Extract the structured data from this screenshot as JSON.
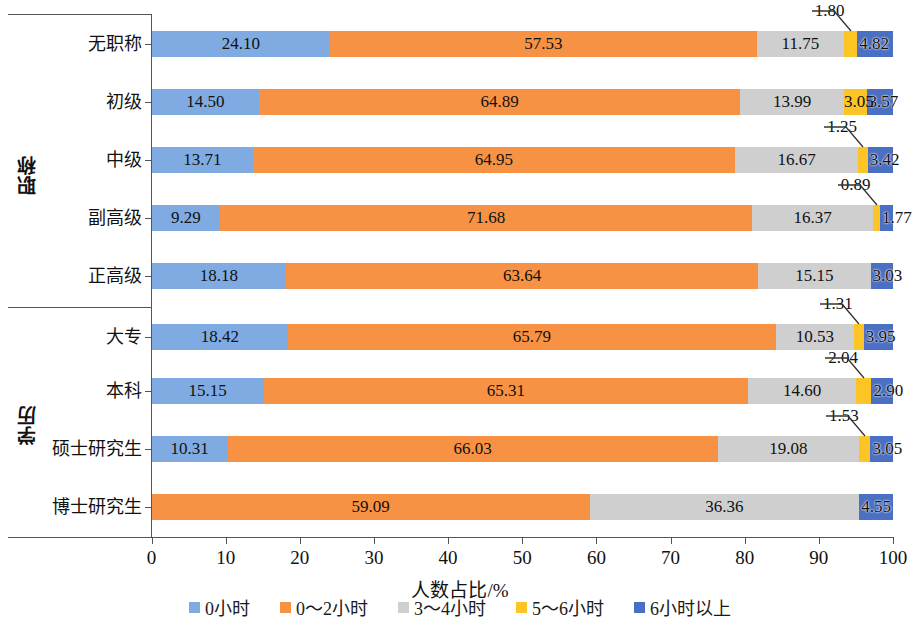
{
  "chart_data": {
    "type": "bar",
    "subtype": "horizontal-stacked-100",
    "title": "",
    "xlabel": "人数占比/%",
    "ylabel": "",
    "xlim": [
      0,
      100
    ],
    "xticks": [
      "0",
      "10",
      "20",
      "30",
      "40",
      "50",
      "60",
      "70",
      "80",
      "90",
      "100"
    ],
    "grid": false,
    "legend_position": "bottom",
    "legend": [
      "0小时",
      "0～2小时",
      "3～4小时",
      "5～6小时",
      "6小时以上"
    ],
    "series_colors": [
      "#7fabe2",
      "#f79244",
      "#cfcfcf",
      "#fcc425",
      "#4a6fc3"
    ],
    "groups": [
      {
        "name": "职称",
        "categories": [
          "无职称",
          "初级",
          "中级",
          "副高级",
          "正高级"
        ]
      },
      {
        "name": "学历",
        "categories": [
          "大专",
          "本科",
          "硕士研究生",
          "博士研究生"
        ]
      }
    ],
    "categories": [
      "无职称",
      "初级",
      "中级",
      "副高级",
      "正高级",
      "大专",
      "本科",
      "硕士研究生",
      "博士研究生"
    ],
    "series": [
      {
        "name": "0小时",
        "values": [
          24.1,
          14.5,
          13.71,
          9.29,
          18.18,
          18.42,
          15.15,
          10.31,
          0
        ]
      },
      {
        "name": "0～2小时",
        "values": [
          57.53,
          64.89,
          64.95,
          71.68,
          63.64,
          65.79,
          65.31,
          66.03,
          59.09
        ]
      },
      {
        "name": "3～4小时",
        "values": [
          11.75,
          13.99,
          16.67,
          16.37,
          15.15,
          10.53,
          14.6,
          19.08,
          36.36
        ]
      },
      {
        "name": "5～6小时",
        "values": [
          1.8,
          3.05,
          1.25,
          0.89,
          0,
          1.31,
          2.04,
          1.53,
          0
        ]
      },
      {
        "name": "6小时以上",
        "values": [
          4.82,
          3.57,
          3.42,
          1.77,
          3.03,
          3.95,
          2.9,
          3.05,
          4.55
        ]
      }
    ],
    "rows": [
      {
        "category": "无职称",
        "labels": [
          "24.10",
          "57.53",
          "11.75",
          "1.80",
          "4.82"
        ],
        "values": [
          24.1,
          57.53,
          11.75,
          1.8,
          4.82
        ]
      },
      {
        "category": "初级",
        "labels": [
          "14.50",
          "64.89",
          "13.99",
          "3.05",
          "3.57"
        ],
        "values": [
          14.5,
          64.89,
          13.99,
          3.05,
          3.57
        ]
      },
      {
        "category": "中级",
        "labels": [
          "13.71",
          "64.95",
          "16.67",
          "1.25",
          "3.42"
        ],
        "values": [
          13.71,
          64.95,
          16.67,
          1.25,
          3.42
        ]
      },
      {
        "category": "副高级",
        "labels": [
          "9.29",
          "71.68",
          "16.37",
          "0.89",
          "1.77"
        ],
        "values": [
          9.29,
          71.68,
          16.37,
          0.89,
          1.77
        ]
      },
      {
        "category": "正高级",
        "labels": [
          "18.18",
          "63.64",
          "15.15",
          "",
          "3.03"
        ],
        "values": [
          18.18,
          63.64,
          15.15,
          0,
          3.03
        ]
      },
      {
        "category": "大专",
        "labels": [
          "18.42",
          "65.79",
          "10.53",
          "1.31",
          "3.95"
        ],
        "values": [
          18.42,
          65.79,
          10.53,
          1.31,
          3.95
        ]
      },
      {
        "category": "本科",
        "labels": [
          "15.15",
          "65.31",
          "14.60",
          "2.04",
          "2.90"
        ],
        "values": [
          15.15,
          65.31,
          14.6,
          2.04,
          2.9
        ]
      },
      {
        "category": "硕士研究生",
        "labels": [
          "10.31",
          "66.03",
          "19.08",
          "1.53",
          "3.05"
        ],
        "values": [
          10.31,
          66.03,
          19.08,
          1.53,
          3.05
        ]
      },
      {
        "category": "博士研究生",
        "labels": [
          "",
          "59.09",
          "36.36",
          "",
          "4.55"
        ],
        "values": [
          0,
          59.09,
          36.36,
          0,
          4.55
        ]
      }
    ]
  }
}
